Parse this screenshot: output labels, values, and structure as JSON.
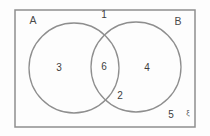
{
  "figure": {
    "type": "venn-diagram",
    "set_a_label": "A",
    "set_b_label": "B",
    "universal_set_symbol": "ξ",
    "region_values": {
      "outside_top": "1",
      "a_only": "3",
      "intersection": "6",
      "b_only": "4",
      "b_lower": "2",
      "outside_bottom_right": "5"
    }
  },
  "colors": {
    "outline": "#8e8e8e",
    "text": "#3d3d3d",
    "background": "#fdfdfd"
  }
}
